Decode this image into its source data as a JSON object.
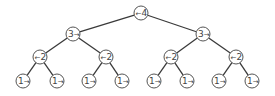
{
  "diagram": {
    "type": "binary-tree",
    "node_radius": 7,
    "colors": {
      "edge": "#3a3a3a",
      "node_stroke": "#555555",
      "text": "#444444",
      "background": "#ffffff"
    },
    "nodes": [
      {
        "id": "n0",
        "x": 141,
        "y": 13,
        "value": "4",
        "arrow": "left"
      },
      {
        "id": "n1",
        "x": 73,
        "y": 34,
        "value": "3",
        "arrow": "right"
      },
      {
        "id": "n2",
        "x": 203,
        "y": 34,
        "value": "3",
        "arrow": "right"
      },
      {
        "id": "n3",
        "x": 40,
        "y": 57,
        "value": "2",
        "arrow": "left"
      },
      {
        "id": "n4",
        "x": 106,
        "y": 57,
        "value": "2",
        "arrow": "left"
      },
      {
        "id": "n5",
        "x": 171,
        "y": 57,
        "value": "2",
        "arrow": "left"
      },
      {
        "id": "n6",
        "x": 236,
        "y": 57,
        "value": "2",
        "arrow": "left"
      },
      {
        "id": "n7",
        "x": 23,
        "y": 81,
        "value": "1",
        "arrow": "right"
      },
      {
        "id": "n8",
        "x": 57,
        "y": 81,
        "value": "1",
        "arrow": "right"
      },
      {
        "id": "n9",
        "x": 89,
        "y": 81,
        "value": "1",
        "arrow": "right"
      },
      {
        "id": "n10",
        "x": 122,
        "y": 81,
        "value": "1",
        "arrow": "right"
      },
      {
        "id": "n11",
        "x": 154,
        "y": 81,
        "value": "1",
        "arrow": "right"
      },
      {
        "id": "n12",
        "x": 187,
        "y": 81,
        "value": "1",
        "arrow": "right"
      },
      {
        "id": "n13",
        "x": 219,
        "y": 81,
        "value": "1",
        "arrow": "right"
      },
      {
        "id": "n14",
        "x": 252,
        "y": 81,
        "value": "1",
        "arrow": "right"
      }
    ],
    "edges": [
      [
        "n0",
        "n1"
      ],
      [
        "n0",
        "n2"
      ],
      [
        "n1",
        "n3"
      ],
      [
        "n1",
        "n4"
      ],
      [
        "n2",
        "n5"
      ],
      [
        "n2",
        "n6"
      ],
      [
        "n3",
        "n7"
      ],
      [
        "n3",
        "n8"
      ],
      [
        "n4",
        "n9"
      ],
      [
        "n4",
        "n10"
      ],
      [
        "n5",
        "n11"
      ],
      [
        "n5",
        "n12"
      ],
      [
        "n6",
        "n13"
      ],
      [
        "n6",
        "n14"
      ]
    ],
    "arrow_glyphs": {
      "left": "←",
      "right": "→"
    }
  }
}
